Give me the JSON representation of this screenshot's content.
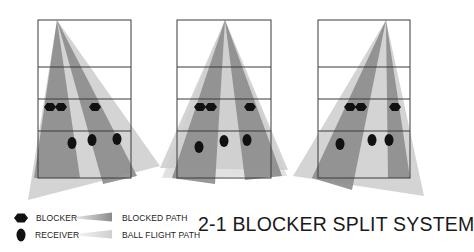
{
  "title": "2-1 BLOCKER SPLIT SYSTEM",
  "legend": {
    "blocker": "BLOCKER",
    "receiver": "RECEIVER",
    "blocked_path": "BLOCKED PATH",
    "ball_flight_path": "BALL FLIGHT PATH"
  },
  "colors": {
    "court_line": "#3a3a3a",
    "blocked_path": "#8a8a8a",
    "ball_flight_path": "#cfcfcf",
    "player": "#111111"
  },
  "panels": [
    {
      "name": "left-attack",
      "blockers": 3,
      "receivers": 3
    },
    {
      "name": "middle-attack",
      "blockers": 3,
      "receivers": 3
    },
    {
      "name": "right-attack",
      "blockers": 3,
      "receivers": 3
    }
  ]
}
